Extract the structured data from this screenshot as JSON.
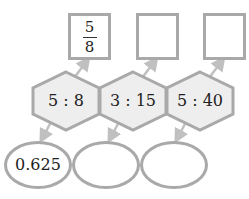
{
  "colors": {
    "stroke": "#a9a9a9",
    "hex_fill": "#eeeeee",
    "arrow": "#c0c0c0"
  },
  "ratios": [
    {
      "label": "5 : 8",
      "fraction": {
        "numerator": "5",
        "denominator": "8"
      },
      "decimal": "0.625"
    },
    {
      "label": "3 : 15",
      "fraction": null,
      "decimal": ""
    },
    {
      "label": "5 : 40",
      "fraction": null,
      "decimal": ""
    }
  ]
}
